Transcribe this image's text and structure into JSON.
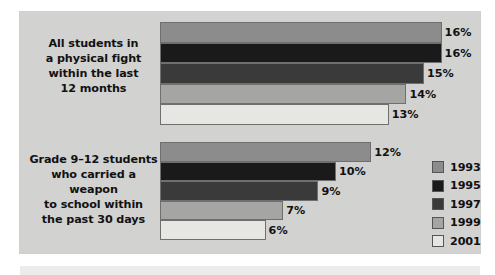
{
  "chart_data": {
    "type": "bar",
    "orientation": "horizontal",
    "title": "",
    "subtitle": "",
    "xlabel": "",
    "ylabel": "",
    "xlim": [
      0,
      18
    ],
    "grid": false,
    "legend_position": "right",
    "categories": [
      "All students in a physical fight within the last 12 months",
      "Grade 9–12 students who carried a weapon to school within the past 30 days"
    ],
    "series": [
      {
        "name": "1993",
        "values": [
          16,
          12
        ],
        "color": "#8c8c8c"
      },
      {
        "name": "1995",
        "values": [
          16,
          10
        ],
        "color": "#1a1a1a"
      },
      {
        "name": "1997",
        "values": [
          15,
          9
        ],
        "color": "#3a3a3a"
      },
      {
        "name": "1999",
        "values": [
          14,
          7
        ],
        "color": "#a5a5a3"
      },
      {
        "name": "2001",
        "values": [
          13,
          6
        ],
        "color": "#e6e6e3"
      }
    ],
    "value_labels": [
      [
        "16%",
        "16%",
        "15%",
        "14%",
        "13%"
      ],
      [
        "12%",
        "10%",
        "9%",
        "7%",
        "6%"
      ]
    ]
  },
  "groups": [
    {
      "id": "group-0",
      "label_lines": [
        "All students in",
        "a physical fight",
        "within the last",
        "12 months"
      ],
      "bars": [
        {
          "year": "1993",
          "value": 16,
          "label": "16%",
          "color": "#8c8c8c",
          "width_pct": 88.0
        },
        {
          "year": "1995",
          "value": 16,
          "label": "16%",
          "color": "#1a1a1a",
          "width_pct": 88.0
        },
        {
          "year": "1997",
          "value": 15,
          "label": "15%",
          "color": "#3a3a3a",
          "width_pct": 82.5
        },
        {
          "year": "1999",
          "value": 14,
          "label": "14%",
          "color": "#a5a5a3",
          "width_pct": 77.0
        },
        {
          "year": "2001",
          "value": 13,
          "label": "13%",
          "color": "#e6e6e3",
          "width_pct": 71.5
        }
      ]
    },
    {
      "id": "group-1",
      "label_lines": [
        "Grade 9–12 students",
        "who carried a weapon",
        "to school within",
        "the past 30 days"
      ],
      "bars": [
        {
          "year": "1993",
          "value": 12,
          "label": "12%",
          "color": "#8c8c8c",
          "width_pct": 66.0
        },
        {
          "year": "1995",
          "value": 10,
          "label": "10%",
          "color": "#1a1a1a",
          "width_pct": 55.0
        },
        {
          "year": "1997",
          "value": 9,
          "label": "9%",
          "color": "#3a3a3a",
          "width_pct": 49.5
        },
        {
          "year": "1999",
          "value": 7,
          "label": "7%",
          "color": "#a5a5a3",
          "width_pct": 38.5
        },
        {
          "year": "2001",
          "value": 6,
          "label": "6%",
          "color": "#e6e6e3",
          "width_pct": 33.0
        }
      ]
    }
  ],
  "legend": {
    "items": [
      {
        "label": "1993",
        "color": "#8c8c8c"
      },
      {
        "label": "1995",
        "color": "#1a1a1a"
      },
      {
        "label": "1997",
        "color": "#3a3a3a"
      },
      {
        "label": "1999",
        "color": "#a5a5a3"
      },
      {
        "label": "2001",
        "color": "#e6e6e3"
      }
    ]
  },
  "panel": {
    "background": "#d2d2d0"
  }
}
